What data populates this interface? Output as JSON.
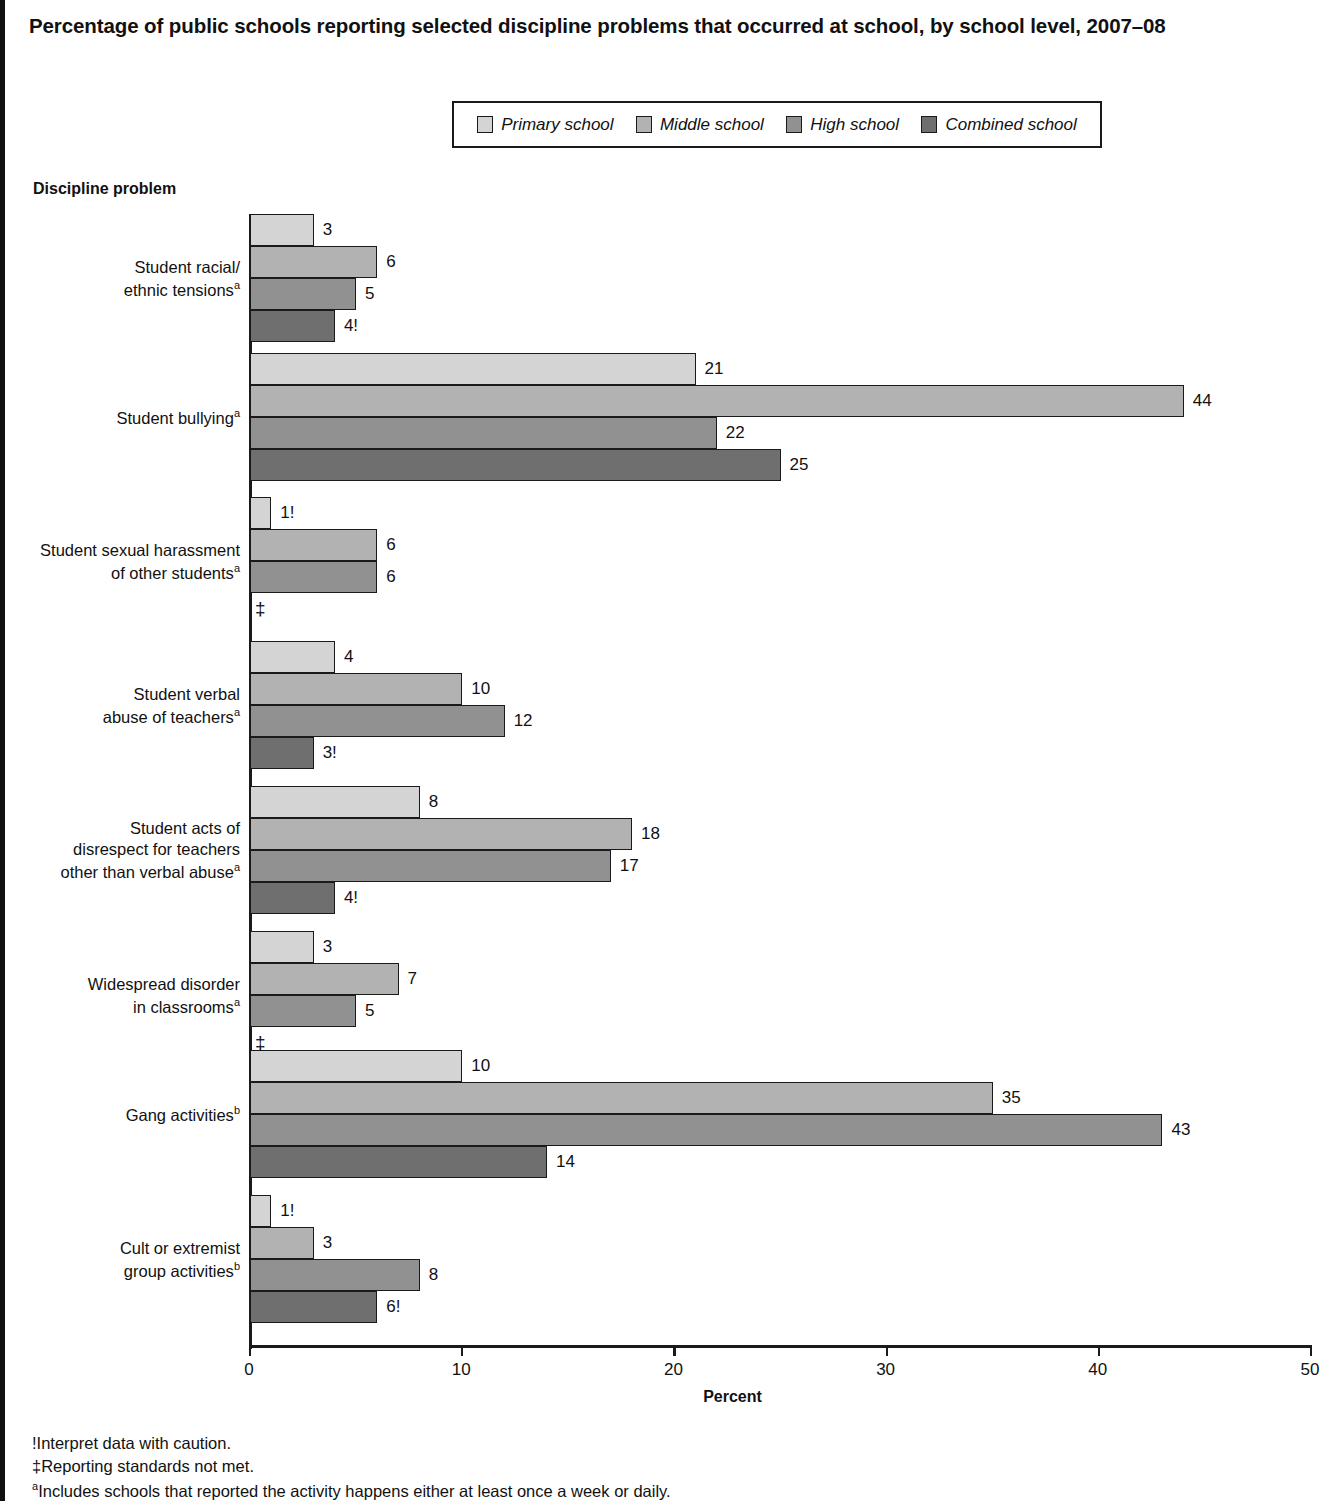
{
  "chart_data": {
    "type": "bar",
    "orientation": "horizontal",
    "title": "Percentage of public schools reporting selected discipline problems that occurred at school, by school level, 2007–08",
    "xlabel": "Percent",
    "ylabel": "Discipline problem",
    "xlim": [
      0,
      50
    ],
    "xticks": [
      0,
      10,
      20,
      30,
      40,
      50
    ],
    "xtick_labels": [
      "0",
      "10",
      "20",
      "30",
      "40",
      "50"
    ],
    "grid": false,
    "legend_position": "top-center",
    "series": [
      {
        "name": "Primary school",
        "color": "#d4d4d4",
        "values": [
          3,
          21,
          1,
          4,
          8,
          3,
          10,
          1
        ]
      },
      {
        "name": "Middle school",
        "color": "#b2b2b2",
        "values": [
          6,
          44,
          6,
          10,
          18,
          7,
          35,
          3
        ]
      },
      {
        "name": "High school",
        "color": "#919191",
        "values": [
          5,
          22,
          6,
          12,
          17,
          5,
          43,
          8
        ]
      },
      {
        "name": "Combined school",
        "color": "#6f6f6f",
        "values": [
          4,
          25,
          null,
          3,
          4,
          null,
          14,
          6
        ]
      }
    ],
    "categories": [
      "Student racial/ ethnic tensions",
      "Student bullying",
      "Student sexual harassment of other students",
      "Student verbal abuse of teachers",
      "Student acts of disrespect for teachers other than verbal abuse",
      "Widespread disorder in classrooms",
      "Gang activities",
      "Cult or extremist group activities"
    ],
    "data_labels": [
      [
        "3",
        "6",
        "5",
        "4!"
      ],
      [
        "21",
        "44",
        "22",
        "25"
      ],
      [
        "1!",
        "6",
        "6",
        "‡"
      ],
      [
        "4",
        "10",
        "12",
        "3!"
      ],
      [
        "8",
        "18",
        "17",
        "4!"
      ],
      [
        "3",
        "7",
        "5",
        "‡"
      ],
      [
        "10",
        "35",
        "43",
        "14"
      ],
      [
        "1!",
        "3",
        "8",
        "6!"
      ]
    ]
  },
  "legend": {
    "items": [
      {
        "label": "Primary school",
        "color": "#d4d4d4"
      },
      {
        "label": "Middle school",
        "color": "#b2b2b2"
      },
      {
        "label": "High school",
        "color": "#919191"
      },
      {
        "label": "Combined school",
        "color": "#6f6f6f"
      }
    ]
  },
  "axis": {
    "y_heading": "Discipline problem",
    "x_title": "Percent",
    "ticks": [
      "0",
      "10",
      "20",
      "30",
      "40",
      "50"
    ]
  },
  "categories": [
    {
      "lines": [
        "Student racial/",
        "ethnic tensions"
      ],
      "footnote_mark": "a",
      "bars": [
        {
          "series": "Primary school",
          "value": 3,
          "label": "3",
          "color": "#d4d4d4"
        },
        {
          "series": "Middle school",
          "value": 6,
          "label": "6",
          "color": "#b2b2b2"
        },
        {
          "series": "High school",
          "value": 5,
          "label": "5",
          "color": "#919191"
        },
        {
          "series": "Combined school",
          "value": 4,
          "label": "4!",
          "color": "#6f6f6f"
        }
      ]
    },
    {
      "lines": [
        "Student bullying"
      ],
      "footnote_mark": "a",
      "bars": [
        {
          "series": "Primary school",
          "value": 21,
          "label": "21",
          "color": "#d4d4d4"
        },
        {
          "series": "Middle school",
          "value": 44,
          "label": "44",
          "color": "#b2b2b2"
        },
        {
          "series": "High school",
          "value": 22,
          "label": "22",
          "color": "#919191"
        },
        {
          "series": "Combined school",
          "value": 25,
          "label": "25",
          "color": "#6f6f6f"
        }
      ]
    },
    {
      "lines": [
        "Student sexual harassment",
        "of other students"
      ],
      "footnote_mark": "a",
      "bars": [
        {
          "series": "Primary school",
          "value": 1,
          "label": "1!",
          "color": "#d4d4d4"
        },
        {
          "series": "Middle school",
          "value": 6,
          "label": "6",
          "color": "#b2b2b2"
        },
        {
          "series": "High school",
          "value": 6,
          "label": "6",
          "color": "#919191"
        },
        {
          "series": "Combined school",
          "value": null,
          "label": "‡",
          "color": "#6f6f6f"
        }
      ]
    },
    {
      "lines": [
        "Student verbal",
        "abuse of teachers"
      ],
      "footnote_mark": "a",
      "bars": [
        {
          "series": "Primary school",
          "value": 4,
          "label": "4",
          "color": "#d4d4d4"
        },
        {
          "series": "Middle school",
          "value": 10,
          "label": "10",
          "color": "#b2b2b2"
        },
        {
          "series": "High school",
          "value": 12,
          "label": "12",
          "color": "#919191"
        },
        {
          "series": "Combined school",
          "value": 3,
          "label": "3!",
          "color": "#6f6f6f"
        }
      ]
    },
    {
      "lines": [
        "Student acts of",
        "disrespect for teachers",
        "other than verbal abuse"
      ],
      "footnote_mark": "a",
      "bars": [
        {
          "series": "Primary school",
          "value": 8,
          "label": "8",
          "color": "#d4d4d4"
        },
        {
          "series": "Middle school",
          "value": 18,
          "label": "18",
          "color": "#b2b2b2"
        },
        {
          "series": "High school",
          "value": 17,
          "label": "17",
          "color": "#919191"
        },
        {
          "series": "Combined school",
          "value": 4,
          "label": "4!",
          "color": "#6f6f6f"
        }
      ]
    },
    {
      "lines": [
        "Widespread disorder",
        "in classrooms"
      ],
      "footnote_mark": "a",
      "bars": [
        {
          "series": "Primary school",
          "value": 3,
          "label": "3",
          "color": "#d4d4d4"
        },
        {
          "series": "Middle school",
          "value": 7,
          "label": "7",
          "color": "#b2b2b2"
        },
        {
          "series": "High school",
          "value": 5,
          "label": "5",
          "color": "#919191"
        },
        {
          "series": "Combined school",
          "value": null,
          "label": "‡",
          "color": "#6f6f6f"
        }
      ]
    },
    {
      "lines": [
        "Gang activities"
      ],
      "footnote_mark": "b",
      "bars": [
        {
          "series": "Primary school",
          "value": 10,
          "label": "10",
          "color": "#d4d4d4"
        },
        {
          "series": "Middle school",
          "value": 35,
          "label": "35",
          "color": "#b2b2b2"
        },
        {
          "series": "High school",
          "value": 43,
          "label": "43",
          "color": "#919191"
        },
        {
          "series": "Combined school",
          "value": 14,
          "label": "14",
          "color": "#6f6f6f"
        }
      ]
    },
    {
      "lines": [
        "Cult or extremist",
        "group activities"
      ],
      "footnote_mark": "b",
      "bars": [
        {
          "series": "Primary school",
          "value": 1,
          "label": "1!",
          "color": "#d4d4d4"
        },
        {
          "series": "Middle school",
          "value": 3,
          "label": "3",
          "color": "#b2b2b2"
        },
        {
          "series": "High school",
          "value": 8,
          "label": "8",
          "color": "#919191"
        },
        {
          "series": "Combined school",
          "value": 6,
          "label": "6!",
          "color": "#6f6f6f"
        }
      ]
    }
  ],
  "footnotes": [
    {
      "mark": "!",
      "sup": false,
      "text": "Interpret data with caution."
    },
    {
      "mark": "‡",
      "sup": false,
      "text": "Reporting standards not met."
    },
    {
      "mark": "a",
      "sup": true,
      "text": "Includes schools that reported the activity happens either at least once a week or daily."
    }
  ]
}
